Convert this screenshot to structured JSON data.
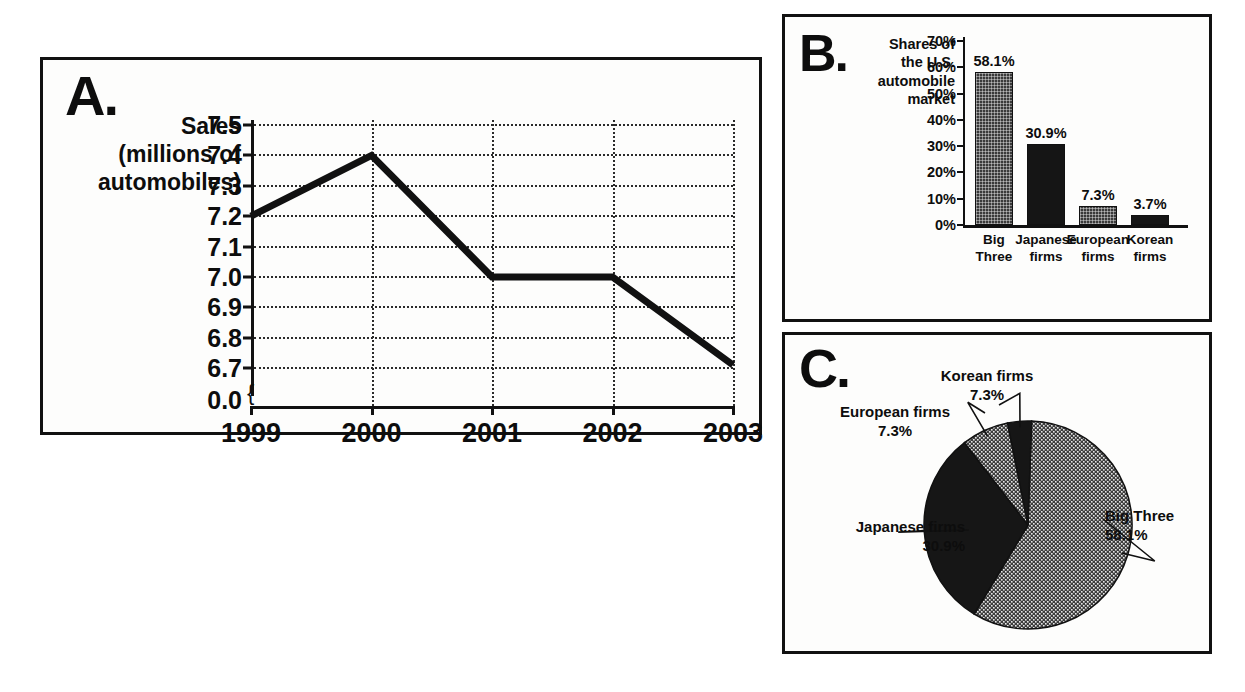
{
  "figure": {
    "panels": [
      "A.",
      "B.",
      "C."
    ]
  },
  "chart_data": [
    {
      "id": "panel-a",
      "panel_label": "A.",
      "type": "line",
      "title": "",
      "ylabel": "Sales (millions of automobiles)",
      "ylabel_lines": [
        "Sales",
        "(millions of",
        "automobiles)"
      ],
      "xlabel": "",
      "categories": [
        "1999",
        "2000",
        "2001",
        "2002",
        "2003"
      ],
      "values": [
        7.2,
        7.4,
        7.0,
        7.0,
        6.71
      ],
      "yticks": [
        "7.5",
        "7.4",
        "7.3",
        "7.2",
        "7.1",
        "7.0",
        "6.9",
        "6.8",
        "6.7",
        "0.0"
      ],
      "ytick_values": [
        7.5,
        7.4,
        7.3,
        7.2,
        7.1,
        7.0,
        6.9,
        6.8,
        6.7
      ],
      "ylim": [
        6.65,
        7.5
      ],
      "axis_break": true,
      "axis_break_label": "0.0",
      "grid": true,
      "legend": "none",
      "line_color": "#111111"
    },
    {
      "id": "panel-b",
      "panel_label": "B.",
      "type": "bar",
      "title": "Shares of the U.S. automobile market",
      "title_lines": [
        "Shares of",
        "the U.S.",
        "automobile",
        "market"
      ],
      "categories": [
        "Big Three",
        "Japanese firms",
        "European firms",
        "Korean firms"
      ],
      "category_lines": [
        [
          "Big",
          "Three"
        ],
        [
          "Japanese",
          "firms"
        ],
        [
          "European",
          "firms"
        ],
        [
          "Korean",
          "firms"
        ]
      ],
      "values": [
        58.1,
        30.9,
        7.3,
        3.7
      ],
      "value_labels": [
        "58.1%",
        "30.9%",
        "7.3%",
        "3.7%"
      ],
      "fills": [
        "hatch",
        "solid",
        "hatch",
        "solid"
      ],
      "yticks": [
        "70%",
        "60%",
        "50%",
        "40%",
        "30%",
        "20%",
        "10%",
        "0%"
      ],
      "ytick_values": [
        70,
        60,
        50,
        40,
        30,
        20,
        10,
        0
      ],
      "ylim": [
        0,
        70
      ],
      "ylabel": "",
      "xlabel": "",
      "grid": false,
      "legend": "none"
    },
    {
      "id": "panel-c",
      "panel_label": "C.",
      "type": "pie",
      "title": "",
      "labels": [
        "Big Three",
        "Japanese firms",
        "European firms",
        "Korean firms"
      ],
      "values": [
        58.1,
        30.9,
        7.3,
        7.3
      ],
      "value_labels": [
        "58.1%",
        "30.9%",
        "7.3%",
        "7.3%"
      ],
      "fills": [
        "hatch",
        "solid",
        "hatch",
        "solid"
      ],
      "legend": "labels-with-leader-lines"
    }
  ]
}
